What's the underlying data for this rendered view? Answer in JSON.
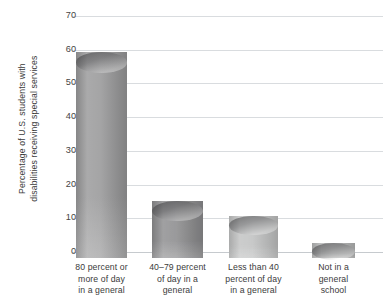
{
  "chart_data": {
    "type": "bar",
    "title": "",
    "subtitle": "",
    "xlabel": "",
    "ylabel": "Percentage of U.S. students with disabilities receiving special services",
    "ylabel_lines": [
      "Percentage of U.S. students with",
      "disabilities receiving special services"
    ],
    "categories": [
      "80 percent or more of day in a general",
      "40–79 percent of day in a general",
      "Less than 40 percent of day in a general",
      "Not in a general school"
    ],
    "category_lines": [
      [
        "80 percent or",
        "more of day",
        "in a general"
      ],
      [
        "40–79 percent",
        "of day in a",
        "general"
      ],
      [
        "Less than 40",
        "percent of day",
        "in a general"
      ],
      [
        "Not in a",
        "general",
        "school"
      ]
    ],
    "values": [
      61,
      17,
      12.5,
      4.5
    ],
    "ylim": [
      0,
      70
    ],
    "yticks": [
      0,
      10,
      20,
      30,
      40,
      50,
      60,
      70
    ],
    "ytick_labels": [
      "0",
      "10",
      "20",
      "30",
      "40",
      "50",
      "60",
      "70"
    ],
    "grid": true,
    "legend": null,
    "bar_style": "cylinder-3d",
    "bar_colors": [
      "#9a9a9b",
      "#8e8e90",
      "#c2c3c3",
      "#b6b7b7"
    ],
    "gridline_color": "#d9dcdf",
    "text_color": "#3b3b3b",
    "background": "#ffffff"
  },
  "axis": {
    "y_title": "Percentage of U.S. students with disabilities receiving special services"
  }
}
